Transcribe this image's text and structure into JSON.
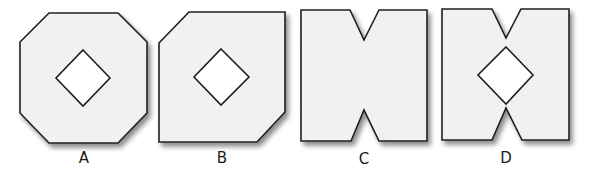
{
  "figure": {
    "colors": {
      "shape_fill": "#f1f1f1",
      "outline": "#1f1f1f",
      "hole_fill": "#ffffff",
      "shadow": "#9a9a9a"
    },
    "shapes": [
      {
        "id": "A",
        "label": "A",
        "form": "octagon",
        "has_hole": true,
        "notches": "none"
      },
      {
        "id": "B",
        "label": "B",
        "form": "square with two opposite corners cut (top-left, bottom-right)",
        "has_hole": true,
        "notches": "none"
      },
      {
        "id": "C",
        "label": "C",
        "form": "rectangle with V-notches top and bottom",
        "has_hole": false,
        "notches": "top-and-bottom"
      },
      {
        "id": "D",
        "label": "D",
        "form": "rectangle with V-notches top and bottom",
        "has_hole": true,
        "notches": "top-and-bottom"
      }
    ]
  }
}
